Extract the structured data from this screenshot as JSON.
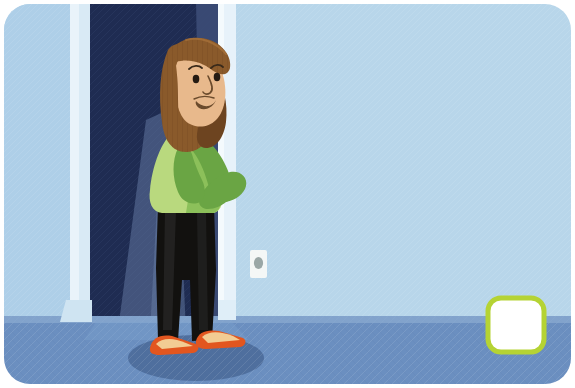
{
  "artwork": {
    "title": "Woman peeking around a doorway",
    "description": "Cartoon illustration of a smiling woman with long brown hair leaning around the edge of a dark open doorway into a light blue room, hands clasped near her chin.",
    "canvas": {
      "width": 575,
      "height": 388,
      "corner_radius": 26
    }
  },
  "palette": {
    "page_background": "#ffffff",
    "wall_left": "#b4d3e9",
    "wall_right": "#b8d6ea",
    "doorframe_light": "#d9eaf5",
    "doorframe_highlight": "#eef6fb",
    "doorway_dark": "#1f2c52",
    "doorway_shade": "#2b3a63",
    "door_edge": "#5d7196",
    "light_spill": "#6d82a8",
    "floor": "#6b8fc0",
    "floor_light": "#7fa0cb",
    "floor_shadow": "#4f6f9e",
    "baseboard": "#cfe4f2",
    "hair": "#8a5a2b",
    "hair_dark": "#6d4420",
    "hair_light": "#a6703a",
    "skin": "#e8b98c",
    "skin_shade": "#d4a276",
    "line": "#3a2a1a",
    "shirt_light": "#b9d97e",
    "shirt_mid": "#8cc05a",
    "shirt_dark": "#6aa544",
    "pants": "#12110f",
    "pants_highlight": "#2a2a2a",
    "shoe_orange": "#e2561f",
    "shoe_top": "#f0c38a",
    "switch_plate": "#f4f7f6",
    "switch_button": "#9aa7a6",
    "callout_border": "#b5d334",
    "callout_fill": "#ffffff"
  },
  "elements": {
    "left_wall": {
      "name": "left-wall",
      "label": "Left wall"
    },
    "doorframe": {
      "name": "door-frame",
      "label": "Door frame"
    },
    "doorway": {
      "name": "dark-doorway",
      "label": "Dark open doorway"
    },
    "light_spill": {
      "name": "light-spill",
      "label": "Light spilling through doorway"
    },
    "right_wall": {
      "name": "right-wall",
      "label": "Right wall"
    },
    "floor": {
      "name": "floor",
      "label": "Floor"
    },
    "floor_shadow": {
      "name": "floor-shadow",
      "label": "Shadow under figure"
    },
    "woman": {
      "name": "woman-figure",
      "label": "Woman peeking around door"
    },
    "hair": {
      "name": "hair",
      "label": "Long brown hair"
    },
    "face": {
      "name": "face",
      "label": "Smiling face"
    },
    "eye_left": {
      "name": "eye-left",
      "label": "Left eye"
    },
    "eye_right": {
      "name": "eye-right",
      "label": "Right eye"
    },
    "eyebrow_left": {
      "name": "eyebrow-left",
      "label": "Left eyebrow"
    },
    "eyebrow_right": {
      "name": "eyebrow-right",
      "label": "Right eyebrow"
    },
    "nose": {
      "name": "nose",
      "label": "Nose"
    },
    "mouth": {
      "name": "mouth",
      "label": "Smiling mouth"
    },
    "shirt": {
      "name": "green-shirt",
      "label": "Green long-sleeve shirt"
    },
    "hands": {
      "name": "clasped-hands",
      "label": "Hands clasped near chin"
    },
    "pants": {
      "name": "black-pants",
      "label": "Black pants"
    },
    "shoe_left": {
      "name": "shoe-left",
      "label": "Left orange shoe"
    },
    "shoe_right": {
      "name": "shoe-right",
      "label": "Right orange shoe"
    },
    "light_switch": {
      "name": "light-switch",
      "label": "Wall light switch plate"
    },
    "callout_box": {
      "name": "callout-box",
      "label": "Empty answer box with green border"
    }
  }
}
